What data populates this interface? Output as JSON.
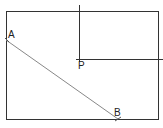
{
  "diagram": {
    "type": "geometry-construction",
    "colors": {
      "stroke": "#333333",
      "segment": "#777777",
      "background": "#ffffff"
    },
    "rectangle": {
      "x": 6,
      "y": 11,
      "width": 152,
      "height": 108
    },
    "points": [
      {
        "name": "A",
        "label": "A",
        "x": 6,
        "y": 40,
        "label_x": 8,
        "label_y": 38
      },
      {
        "name": "B",
        "label": "B",
        "x": 118,
        "y": 119,
        "label_x": 114,
        "label_y": 116
      },
      {
        "name": "P",
        "label": "P",
        "x": 79,
        "y": 59,
        "label_x": 79,
        "label_y": 69
      }
    ],
    "lines": [
      {
        "name": "vertical-through-P",
        "x1": 79,
        "y1": 5,
        "x2": 79,
        "y2": 59
      },
      {
        "name": "horizontal-through-P",
        "x1": 79,
        "y1": 59,
        "x2": 163,
        "y2": 59
      },
      {
        "name": "segment-AB",
        "x1": 6,
        "y1": 40,
        "x2": 118,
        "y2": 119
      }
    ]
  }
}
